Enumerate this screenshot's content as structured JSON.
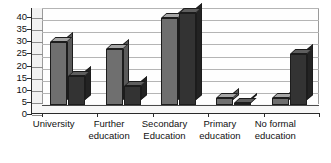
{
  "chart_data": {
    "type": "bar",
    "title": "",
    "subtitle": "",
    "xlabel": "",
    "ylabel": "",
    "ylim": [
      0,
      40
    ],
    "ytick_step": 5,
    "yticks": [
      0,
      5,
      10,
      15,
      20,
      25,
      30,
      35,
      40
    ],
    "ytick_labels": [
      "0",
      "5",
      "10",
      "15",
      "20",
      "25",
      "30",
      "35",
      "40"
    ],
    "grid": true,
    "grid_axis": "y",
    "legend": false,
    "legend_position": "none",
    "style": "3d-clustered-column",
    "categories": [
      "University",
      "Further education",
      "Secondary Education",
      "Primary education",
      "No formal education"
    ],
    "category_lines": [
      [
        "University"
      ],
      [
        "Further",
        "education"
      ],
      [
        "Secondary",
        "Education"
      ],
      [
        "Primary",
        "education"
      ],
      [
        "No formal",
        "education"
      ]
    ],
    "series": [
      {
        "name": "Series 1",
        "color": "#6f6f6f",
        "values": [
          26,
          23,
          36,
          3,
          3
        ]
      },
      {
        "name": "Series 2",
        "color": "#333333",
        "values": [
          12,
          8,
          38,
          1,
          21
        ]
      }
    ]
  },
  "colors": {
    "series_light": "#6f6f6f",
    "series_dark": "#333333",
    "gridline": "#b4b4b4",
    "axis": "#2b2b2b",
    "plot_background": "#fefefe",
    "page_background": "#ffffff"
  }
}
